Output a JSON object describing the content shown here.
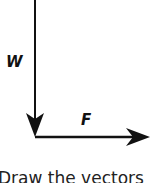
{
  "diagram": {
    "vectors": [
      {
        "label": "W",
        "direction": "down"
      },
      {
        "label": "F",
        "direction": "right"
      }
    ],
    "caption": "Draw the vectors",
    "stroke_color": "#111111"
  }
}
